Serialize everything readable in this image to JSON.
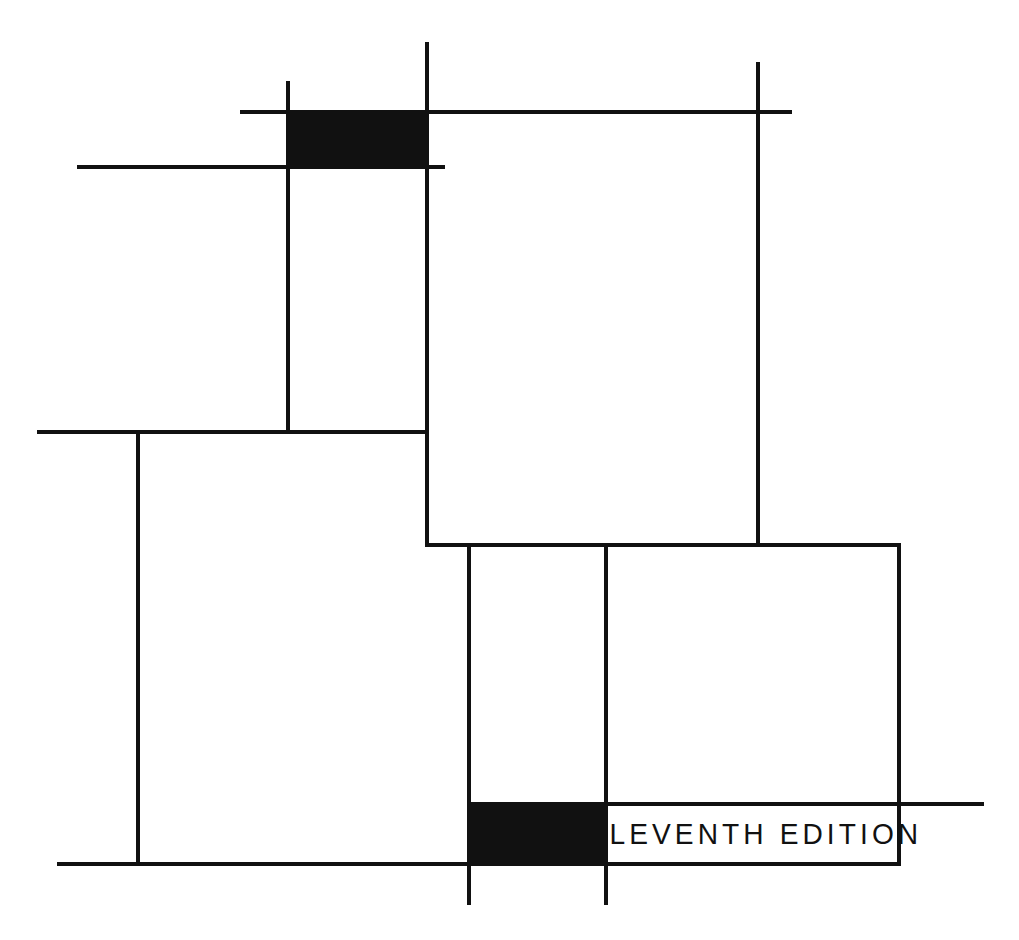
{
  "artwork": {
    "title": "Eleventh Edition",
    "style": "mondrian-grid-book-cover",
    "background_color": "#ffffff",
    "line_color": "#111111",
    "canvas": {
      "width": 1019,
      "height": 940
    }
  },
  "edition_label": {
    "text": "ELEVENTH EDITION",
    "color": "#111111"
  },
  "black_blocks": [
    {
      "name": "upper-black-block",
      "x": 288,
      "y": 111,
      "width": 139,
      "height": 56,
      "color": "#111111"
    },
    {
      "name": "lower-black-block",
      "x": 468,
      "y": 805,
      "width": 138,
      "height": 58,
      "color": "#111111"
    }
  ],
  "horizontal_rules": [
    {
      "name": "top-upper-rule",
      "x": 240,
      "y": 110,
      "length": 552,
      "thickness": 4
    },
    {
      "name": "top-lower-rule",
      "x": 77,
      "y": 165,
      "length": 368,
      "thickness": 4
    },
    {
      "name": "mid-left-rule",
      "x": 37,
      "y": 430,
      "length": 392,
      "thickness": 4
    },
    {
      "name": "mid-right-rule",
      "x": 427,
      "y": 543,
      "length": 474,
      "thickness": 4
    },
    {
      "name": "label-top-rule",
      "x": 468,
      "y": 802,
      "length": 516,
      "thickness": 4
    },
    {
      "name": "bottom-rule",
      "x": 57,
      "y": 862,
      "length": 844,
      "thickness": 4
    }
  ],
  "vertical_rules": [
    {
      "name": "left-long-vrule",
      "x": 136,
      "y": 430,
      "length": 434,
      "thickness": 4
    },
    {
      "name": "upper-left-vrule",
      "x": 286,
      "y": 81,
      "length": 353,
      "thickness": 4
    },
    {
      "name": "center-tall-vrule",
      "x": 425,
      "y": 42,
      "length": 505,
      "thickness": 4
    },
    {
      "name": "lower-left-inner-vrule",
      "x": 467,
      "y": 543,
      "length": 362,
      "thickness": 4
    },
    {
      "name": "lower-mid-vrule",
      "x": 604,
      "y": 543,
      "length": 362,
      "thickness": 4
    },
    {
      "name": "upper-right-vrule",
      "x": 756,
      "y": 62,
      "length": 483,
      "thickness": 4
    },
    {
      "name": "right-panel-vrule",
      "x": 897,
      "y": 543,
      "length": 321,
      "thickness": 4
    }
  ],
  "label_box": {
    "x": 606,
    "y": 805,
    "width": 293,
    "height": 58
  }
}
